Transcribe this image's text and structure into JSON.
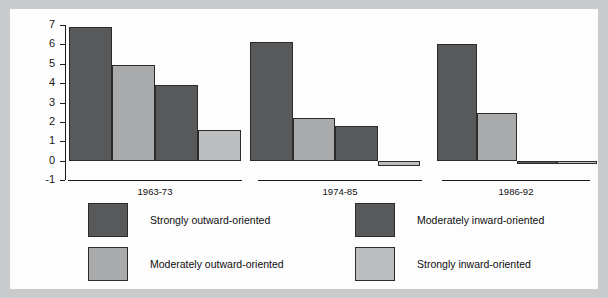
{
  "chart_data": {
    "type": "bar",
    "title": "",
    "subtitle": "",
    "xlabel": "",
    "ylabel": "",
    "ylim": [
      -1,
      7
    ],
    "yticks": [
      -1,
      0,
      1,
      2,
      3,
      4,
      5,
      6,
      7
    ],
    "ytick_labels": [
      "-1",
      "0",
      "1",
      "2",
      "3",
      "4",
      "5",
      "6",
      "7"
    ],
    "grid": false,
    "legend_position": "bottom",
    "categories": [
      "1963-73",
      "1974-85",
      "1986-92"
    ],
    "series": [
      {
        "name": "Strongly outward-oriented",
        "color": "#58595b",
        "values": [
          6.9,
          6.1,
          6.0
        ]
      },
      {
        "name": "Moderately outward-oriented",
        "color": "#a9aaac",
        "values": [
          4.95,
          2.2,
          2.45
        ]
      },
      {
        "name": "Moderately inward-oriented",
        "color": "#58595b",
        "values": [
          3.9,
          1.8,
          -0.05
        ]
      },
      {
        "name": "Strongly inward-oriented",
        "color": "#bcbdbf",
        "values": [
          1.6,
          -0.3,
          -0.1
        ]
      }
    ]
  },
  "axis": {
    "tick_labels": [
      "7",
      "6",
      "5",
      "4",
      "3",
      "2",
      "1",
      "0",
      "-1"
    ]
  },
  "groups": [
    {
      "label": "1963-73"
    },
    {
      "label": "1974-85"
    },
    {
      "label": "1986-92"
    }
  ],
  "legend": {
    "items": [
      {
        "label": "Strongly outward-oriented",
        "color": "#58595b"
      },
      {
        "label": "Moderately outward-oriented",
        "color": "#a9aaac"
      },
      {
        "label": "Moderately inward-oriented",
        "color": "#58595b"
      },
      {
        "label": "Strongly inward-oriented",
        "color": "#bcbdbf"
      }
    ]
  },
  "colors": {
    "page_background": "#c9cacb",
    "figure_background": "#fdfdfd",
    "axis": "#1b1b1b",
    "bar_outline": "#2b2b2b"
  }
}
